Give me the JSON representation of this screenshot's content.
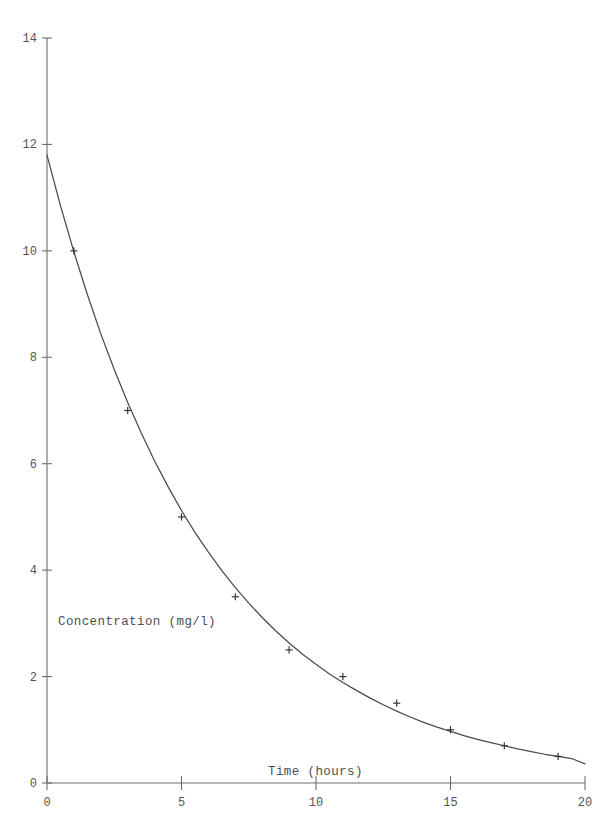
{
  "chart_data": {
    "type": "scatter",
    "title": "",
    "subtitle": "",
    "xlabel": "Time (hours)",
    "ylabel": "Concentration (mg/l)",
    "xlim": [
      0,
      20
    ],
    "ylim": [
      0,
      14
    ],
    "xticks": [
      0,
      5,
      10,
      15,
      20
    ],
    "yticks": [
      0,
      2,
      4,
      6,
      8,
      10,
      12,
      14
    ],
    "xtick_labels": [
      "0",
      "5",
      "10",
      "15",
      "20"
    ],
    "ytick_labels": [
      "0",
      "2",
      "4",
      "6",
      "8",
      "10",
      "12",
      "14"
    ],
    "grid": false,
    "legend": null,
    "legend_position": "none",
    "marker_symbol": "+",
    "x": [
      1,
      3,
      5,
      7,
      9,
      11,
      13,
      15,
      17,
      19
    ],
    "values": [
      10,
      7,
      5,
      3.5,
      2.5,
      2,
      1.5,
      1,
      0.7,
      0.5
    ],
    "series": [
      {
        "name": "Observed concentration",
        "x": [
          1,
          3,
          5,
          7,
          9,
          11,
          13,
          15,
          17,
          19
        ],
        "values": [
          10,
          7,
          5,
          3.5,
          2.5,
          2,
          1.5,
          1,
          0.7,
          0.5
        ],
        "style": "points"
      },
      {
        "name": "Fitted exponential decay curve",
        "x": [
          0,
          0.5,
          1,
          1.5,
          2,
          2.5,
          3,
          3.5,
          4,
          4.5,
          5,
          5.5,
          6,
          6.5,
          7,
          7.5,
          8,
          8.5,
          9,
          9.5,
          10,
          10.5,
          11,
          11.5,
          12,
          12.5,
          13,
          13.5,
          14,
          14.5,
          15,
          15.5,
          16,
          16.5,
          17,
          17.5,
          18,
          18.5,
          19,
          19.5,
          20
        ],
        "values": [
          11.8,
          10.85,
          9.98,
          9.18,
          8.44,
          7.77,
          7.15,
          6.58,
          6.05,
          5.57,
          5.12,
          4.71,
          4.34,
          3.99,
          3.67,
          3.38,
          3.11,
          2.86,
          2.63,
          2.42,
          2.23,
          2.05,
          1.89,
          1.74,
          1.6,
          1.47,
          1.35,
          1.24,
          1.14,
          1.05,
          0.97,
          0.89,
          0.82,
          0.76,
          0.7,
          0.64,
          0.59,
          0.54,
          0.5,
          0.46,
          0.36
        ],
        "style": "line"
      }
    ],
    "annotations": []
  },
  "axes": {
    "x_axis_title": "Time (hours)",
    "y_axis_title": "Concentration (mg/l)"
  },
  "caption": {
    "text": ""
  },
  "colors": {
    "curve": "#4a4a4a",
    "axis": "#6e6e6e",
    "marker": "#2f2f2f",
    "text": "#555555",
    "background": "#ffffff"
  }
}
